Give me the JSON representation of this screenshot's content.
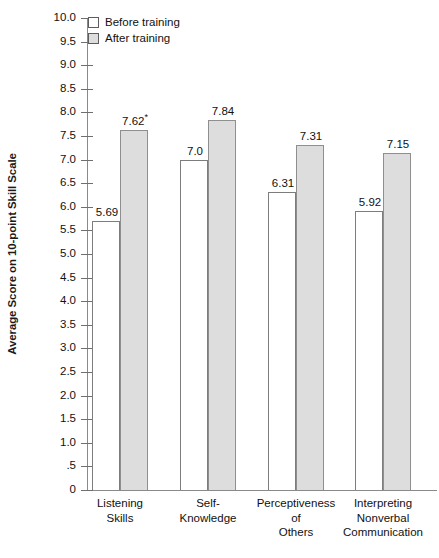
{
  "chart_data": {
    "type": "bar",
    "title": "",
    "xlabel": "",
    "ylabel": "Average Score on 10-point Skill Scale",
    "ylim": [
      0,
      10
    ],
    "ytick_step": 0.5,
    "grid": false,
    "legend_position": "top-left",
    "categories": [
      "Listening\nSkills",
      "Self-\nKnowledge",
      "Perceptiveness\nof\nOthers",
      "Interpreting\nNonverbal\nCommunication"
    ],
    "category_lines": [
      [
        "Listening",
        "Skills"
      ],
      [
        "Self-",
        "Knowledge"
      ],
      [
        "Perceptiveness",
        "of",
        "Others"
      ],
      [
        "Interpreting",
        "Nonverbal",
        "Communication"
      ]
    ],
    "series": [
      {
        "name": "Before training",
        "color": "#ffffff",
        "values": [
          5.69,
          7.0,
          6.31,
          5.92
        ],
        "labels": [
          "5.69",
          "7.0",
          "6.31",
          "5.92"
        ]
      },
      {
        "name": "After training",
        "color": "#dddddd",
        "values": [
          7.62,
          7.84,
          7.31,
          7.15
        ],
        "labels": [
          "7.62",
          "7.84",
          "7.31",
          "7.15"
        ],
        "label_marks": [
          "*",
          "",
          "",
          ""
        ]
      }
    ],
    "ytick_labels": [
      "10.0",
      "9.5",
      "9.0",
      "8.5",
      "8.0",
      "7.5",
      "7.0",
      "6.5",
      "6.0",
      "5.5",
      "5.0",
      "4.5",
      "4.0",
      "3.5",
      "3.0",
      "2.5",
      "2.0",
      "1.5",
      "1.0",
      ".5",
      "0"
    ],
    "ytick_values": [
      10,
      9.5,
      9,
      8.5,
      8,
      7.5,
      7,
      6.5,
      6,
      5.5,
      5,
      4.5,
      4,
      3.5,
      3,
      2.5,
      2,
      1.5,
      1,
      0.5,
      0
    ],
    "annotation_note": "*"
  },
  "legend": {
    "items": [
      {
        "label": "Before training",
        "swatch": "white"
      },
      {
        "label": "After training",
        "swatch": "gray"
      }
    ]
  },
  "axis": {
    "y_title": "Average Score on 10-point Skill Scale"
  }
}
